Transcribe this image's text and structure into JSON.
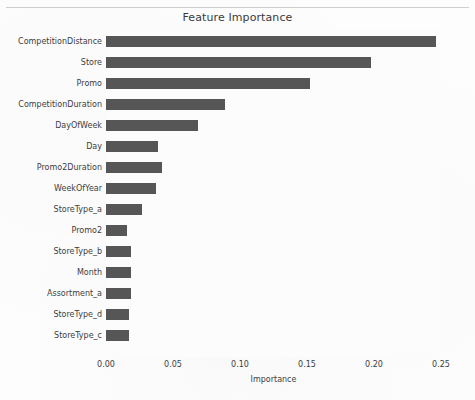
{
  "chart_data": {
    "type": "bar",
    "orientation": "horizontal",
    "title": "Feature Importance",
    "xlabel": "Importance",
    "ylabel": "",
    "xlim": [
      0.0,
      0.26
    ],
    "xticks": [
      "0.00",
      "0.05",
      "0.10",
      "0.15",
      "0.20",
      "0.25"
    ],
    "xtick_values": [
      0.0,
      0.05,
      0.1,
      0.15,
      0.2,
      0.25
    ],
    "grid": false,
    "legend": "none",
    "bar_color": "#565656",
    "background_color": "#fcfcfc",
    "categories": [
      "CompetitionDistance",
      "Store",
      "Promo",
      "CompetitionDuration",
      "DayOfWeek",
      "Day",
      "Promo2Duration",
      "WeekOfYear",
      "StoreType_a",
      "Promo2",
      "StoreType_b",
      "Month",
      "Assortment_a",
      "StoreType_d",
      "StoreType_c"
    ],
    "values": [
      0.246,
      0.198,
      0.152,
      0.089,
      0.069,
      0.039,
      0.042,
      0.037,
      0.027,
      0.016,
      0.019,
      0.019,
      0.019,
      0.017,
      0.017
    ]
  }
}
